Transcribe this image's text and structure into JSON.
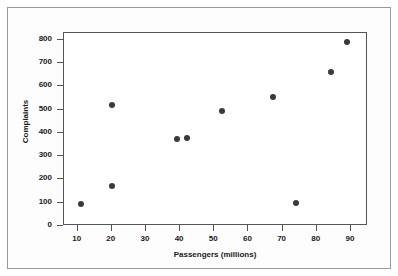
{
  "chart_data": {
    "type": "scatter",
    "title": "",
    "xlabel": "Passengers (millions)",
    "ylabel": "Complaints",
    "xlim": [
      6,
      95
    ],
    "ylim": [
      0,
      830
    ],
    "xticks": [
      10,
      20,
      30,
      40,
      50,
      60,
      70,
      80,
      90
    ],
    "xtick_labels": [
      "10",
      "20",
      "30",
      "40",
      "50",
      "60",
      "70",
      "80",
      "90"
    ],
    "yticks": [
      0,
      100,
      200,
      300,
      400,
      500,
      600,
      700,
      800
    ],
    "ytick_labels": [
      "0",
      "100",
      "200",
      "300",
      "400",
      "500",
      "600",
      "700",
      "800"
    ],
    "grid": false,
    "legend": false,
    "marker": "filled-circle",
    "marker_color": "#3a3a3a",
    "points": [
      {
        "x": 11.2,
        "y": 90
      },
      {
        "x": 20.3,
        "y": 518
      },
      {
        "x": 20.3,
        "y": 168
      },
      {
        "x": 39.4,
        "y": 370
      },
      {
        "x": 42.3,
        "y": 375
      },
      {
        "x": 52.6,
        "y": 491
      },
      {
        "x": 67.6,
        "y": 552
      },
      {
        "x": 74.1,
        "y": 95
      },
      {
        "x": 84.4,
        "y": 660
      },
      {
        "x": 89.1,
        "y": 785
      }
    ]
  },
  "style": {
    "axis_color": "#555555",
    "frame_color": "#9a9a9a",
    "text_color": "#1a1a1a",
    "background": "#ffffff"
  }
}
